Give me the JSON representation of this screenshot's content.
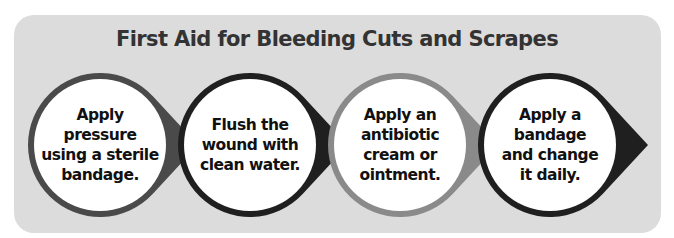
{
  "title": "First Aid for Bleeding Cuts and Scrapes",
  "steps": [
    {
      "lines": [
        "Apply",
        "pressure",
        "using a sterile",
        "bandage."
      ],
      "color": "#4a4a4a"
    },
    {
      "lines": [
        "Flush the",
        "wound with",
        "clean water."
      ],
      "color": "#1f1f1f"
    },
    {
      "lines": [
        "Apply an",
        "antibiotic",
        "cream or",
        "ointment."
      ],
      "color": "#8a8a8a"
    },
    {
      "lines": [
        "Apply a",
        "bandage",
        "and change",
        "it daily."
      ],
      "color": "#1f1f1f"
    }
  ],
  "colors": {
    "panel": "#dcdcdc",
    "title": "#333333",
    "circle_fill": "#ffffff"
  }
}
